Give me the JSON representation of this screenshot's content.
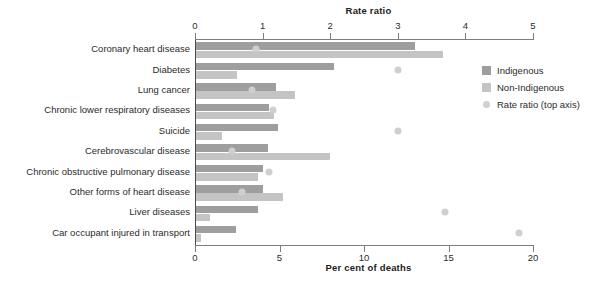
{
  "chart_data": {
    "type": "bar",
    "orientation": "horizontal",
    "title": "",
    "xlabel": "Per cent of deaths",
    "xlabel_top": "Rate ratio",
    "ylabel": "",
    "xlim": [
      0,
      20
    ],
    "xlim_top": [
      0,
      5
    ],
    "grid": false,
    "legend_position": "right",
    "xticks_bottom": [
      "0",
      "5",
      "10",
      "15",
      "20"
    ],
    "xticks_top": [
      "0",
      "1",
      "2",
      "3",
      "4",
      "5"
    ],
    "xtick_values_bottom": [
      0,
      5,
      10,
      15,
      20
    ],
    "xtick_values_top": [
      0,
      1,
      2,
      3,
      4,
      5
    ],
    "categories": [
      "Coronary heart disease",
      "Diabetes",
      "Lung cancer",
      "Chronic lower respiratory diseases",
      "Suicide",
      "Cerebrovascular disease",
      "Chronic obstructive pulmonary disease",
      "Other forms of heart disease",
      "Liver diseases",
      "Car occupant injured in transport"
    ],
    "series": [
      {
        "name": "Indigenous",
        "axis": "bottom",
        "color": "#9e9e9e",
        "values": [
          13.0,
          8.2,
          4.8,
          4.4,
          4.9,
          4.3,
          4.0,
          4.0,
          3.7,
          2.4
        ]
      },
      {
        "name": "Non-Indigenous",
        "axis": "bottom",
        "color": "#c4c4c4",
        "values": [
          14.7,
          2.5,
          5.9,
          4.7,
          1.6,
          8.0,
          3.7,
          5.2,
          0.9,
          0.35
        ]
      },
      {
        "name": "Rate ratio (top axis)",
        "axis": "top",
        "marker": "circle",
        "color": "#cfcfcf",
        "values": [
          0.9,
          3.0,
          0.85,
          1.15,
          3.0,
          0.55,
          1.1,
          0.7,
          3.7,
          4.8
        ]
      }
    ],
    "legend": [
      {
        "label": "Indigenous",
        "swatch": "square",
        "color": "#9e9e9e"
      },
      {
        "label": "Non-Indigenous",
        "swatch": "square",
        "color": "#c4c4c4"
      },
      {
        "label": "Rate ratio (top axis)",
        "swatch": "circle",
        "color": "#cfcfcf"
      }
    ]
  }
}
